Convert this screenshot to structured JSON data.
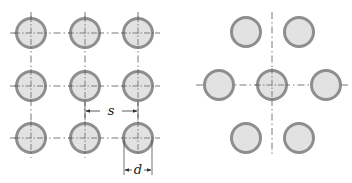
{
  "diagram": {
    "colors": {
      "tube_fill": "#e2e2e2",
      "tube_ring": "#8e8e8e",
      "centerline": "#555555",
      "dimension": "#333333"
    },
    "left": {
      "name": "in-line arrangement",
      "tubes": [
        {
          "cx": 31,
          "cy": 33
        },
        {
          "cx": 85,
          "cy": 33
        },
        {
          "cx": 138,
          "cy": 33
        },
        {
          "cx": 31,
          "cy": 86
        },
        {
          "cx": 85,
          "cy": 86
        },
        {
          "cx": 138,
          "cy": 86
        },
        {
          "cx": 31,
          "cy": 138
        },
        {
          "cx": 85,
          "cy": 138
        },
        {
          "cx": 138,
          "cy": 138
        }
      ],
      "pitch_label": "s",
      "diameter_label": "d"
    },
    "right": {
      "name": "staggered arrangement",
      "tubes": [
        {
          "cx": 246,
          "cy": 32
        },
        {
          "cx": 299,
          "cy": 32
        },
        {
          "cx": 219,
          "cy": 85
        },
        {
          "cx": 272,
          "cy": 85
        },
        {
          "cx": 326,
          "cy": 85
        },
        {
          "cx": 246,
          "cy": 138
        },
        {
          "cx": 299,
          "cy": 138
        }
      ]
    }
  }
}
